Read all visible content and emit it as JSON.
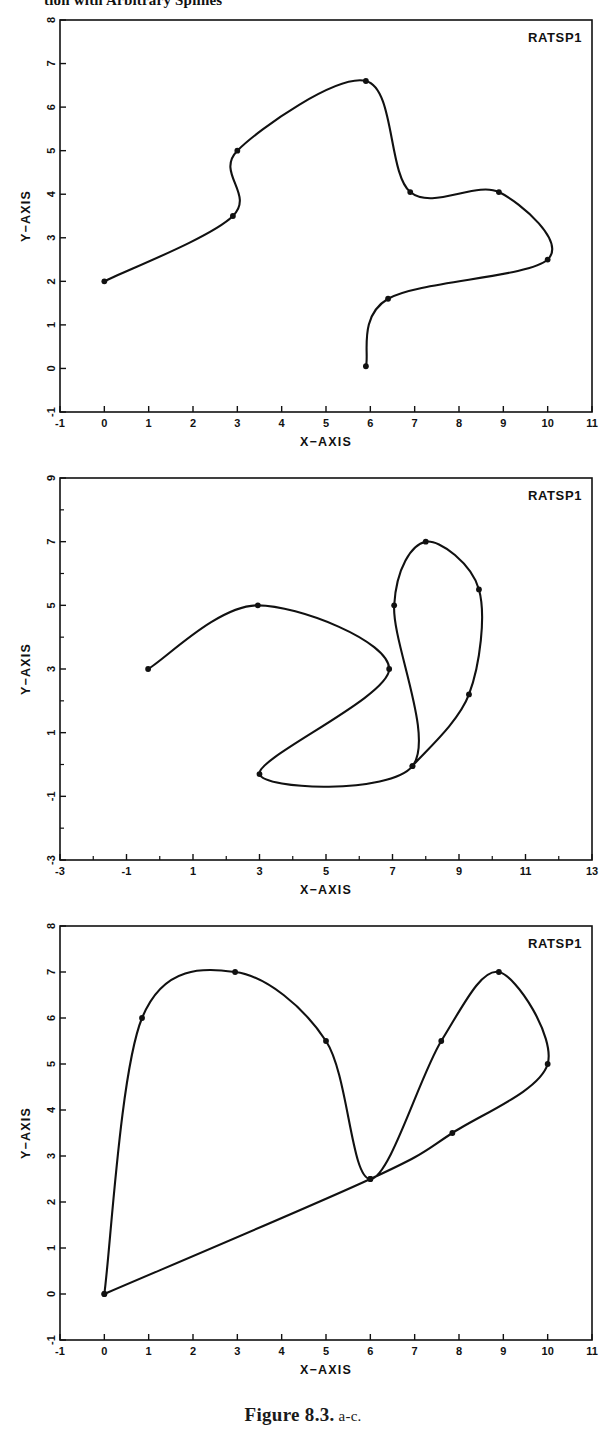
{
  "page": {
    "running_head": "tion with Arbitrary Splines",
    "caption_strong": "Figure 8.3.",
    "caption_rest": "a-c."
  },
  "figures": [
    {
      "id": "a",
      "corner_label": "RATSP1",
      "chart_data": {
        "type": "line",
        "title": "RATSP1",
        "xlabel": "X−AXIS",
        "ylabel": "Y−AXIS",
        "xlim": [
          -1,
          11
        ],
        "ylim": [
          -1,
          8
        ],
        "xticks": [
          "-1",
          "0",
          "1",
          "2",
          "3",
          "4",
          "5",
          "6",
          "7",
          "8",
          "9",
          "10",
          "11"
        ],
        "yticks": [
          "-1",
          "0",
          "1",
          "2",
          "3",
          "4",
          "5",
          "6",
          "7",
          "8"
        ],
        "grid": false,
        "legend": "none",
        "series": [
          {
            "name": "RATSP1",
            "marker": "filled-circle",
            "interpolation": "spline",
            "points": [
              [
                0.0,
                2.0
              ],
              [
                2.9,
                3.5
              ],
              [
                3.0,
                5.0
              ],
              [
                5.9,
                6.6
              ],
              [
                6.9,
                4.05
              ],
              [
                8.9,
                4.05
              ],
              [
                10.0,
                2.5
              ],
              [
                6.4,
                1.6
              ],
              [
                5.9,
                0.05
              ]
            ]
          }
        ]
      }
    },
    {
      "id": "b",
      "corner_label": "RATSP1",
      "chart_data": {
        "type": "line",
        "title": "RATSP1",
        "xlabel": "X−AXIS",
        "ylabel": "Y−AXIS",
        "xlim": [
          -3,
          13
        ],
        "ylim": [
          -3,
          9
        ],
        "xticks": [
          "-3",
          "-1",
          "1",
          "3",
          "5",
          "7",
          "9",
          "11",
          "13"
        ],
        "yticks": [
          "-3",
          "-1",
          "1",
          "3",
          "5",
          "7",
          "9"
        ],
        "grid": false,
        "legend": "none",
        "series": [
          {
            "name": "RATSP1",
            "marker": "filled-circle",
            "interpolation": "spline",
            "points": [
              [
                -0.35,
                3.0
              ],
              [
                2.95,
                5.0
              ],
              [
                6.9,
                3.0
              ],
              [
                3.0,
                -0.3
              ],
              [
                7.6,
                -0.05
              ],
              [
                7.05,
                5.0
              ],
              [
                8.0,
                7.0
              ],
              [
                9.6,
                5.5
              ],
              [
                9.3,
                2.2
              ],
              [
                7.6,
                -0.05
              ]
            ]
          }
        ]
      }
    },
    {
      "id": "c",
      "corner_label": "RATSP1",
      "chart_data": {
        "type": "line",
        "title": "RATSP1",
        "xlabel": "X−AXIS",
        "ylabel": "Y−AXIS",
        "xlim": [
          -1,
          11
        ],
        "ylim": [
          -1,
          8
        ],
        "xticks": [
          "-1",
          "0",
          "1",
          "2",
          "3",
          "4",
          "5",
          "6",
          "7",
          "8",
          "9",
          "10",
          "11"
        ],
        "yticks": [
          "-1",
          "0",
          "1",
          "2",
          "3",
          "4",
          "5",
          "6",
          "7",
          "8"
        ],
        "grid": false,
        "legend": "none",
        "series": [
          {
            "name": "RATSP1",
            "marker": "filled-circle",
            "interpolation": "spline",
            "points": [
              [
                0.0,
                0.0
              ],
              [
                0.85,
                6.0
              ],
              [
                2.95,
                7.0
              ],
              [
                5.0,
                5.5
              ],
              [
                6.0,
                2.5
              ],
              [
                7.6,
                5.5
              ],
              [
                8.9,
                7.0
              ],
              [
                10.0,
                5.0
              ],
              [
                7.85,
                3.5
              ],
              [
                6.0,
                2.5
              ],
              [
                0.0,
                0.0
              ]
            ]
          }
        ]
      }
    }
  ]
}
